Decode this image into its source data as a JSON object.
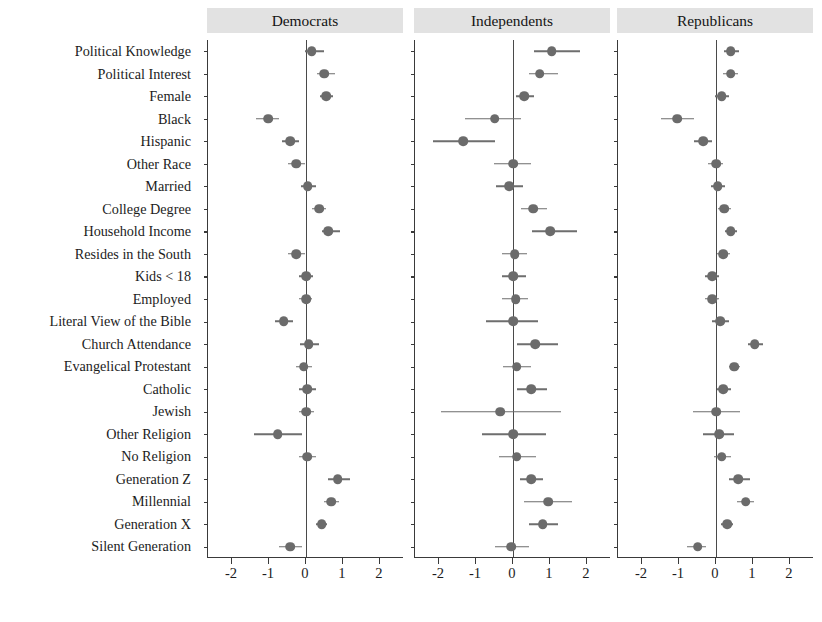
{
  "figure": {
    "panels": [
      "Democrats",
      "Independents",
      "Republicans"
    ],
    "xticks": [
      "-2",
      "-1",
      "0",
      "1",
      "2"
    ],
    "point_color": "#6b6b6b",
    "ci_color": "#6e6e6e",
    "header_background": "#e2e2e2"
  },
  "chart_data": {
    "type": "scatter",
    "title": "",
    "xlabel": "",
    "ylabel": "",
    "xlim": [
      -2.65,
      2.65
    ],
    "grid": false,
    "legend": "none",
    "panel_layout": "three horizontal panels sharing y-axis categories",
    "reference_line": 0,
    "xticks": [
      -2,
      -1,
      0,
      1,
      2
    ],
    "categories": [
      "Political Knowledge",
      "Political Interest",
      "Female",
      "Black",
      "Hispanic",
      "Other Race",
      "Married",
      "College Degree",
      "Household Income",
      "Resides in the South",
      "Kids < 18",
      "Employed",
      "Literal View of the Bible",
      "Church Attendance",
      "Evangelical Protestant",
      "Catholic",
      "Jewish",
      "Other Religion",
      "No Religion",
      "Generation Z",
      "Millennial",
      "Generation X",
      "Silent Generation"
    ],
    "series": [
      {
        "name": "Democrats",
        "values": [
          0.15,
          0.5,
          0.55,
          -1.02,
          -0.42,
          -0.26,
          0.05,
          0.35,
          0.6,
          -0.26,
          0.0,
          0.0,
          -0.6,
          0.07,
          -0.06,
          0.03,
          0.0,
          -0.76,
          0.03,
          0.86,
          0.68,
          0.42,
          -0.42
        ],
        "ci_low": [
          -0.04,
          0.3,
          0.38,
          -1.34,
          -0.66,
          -0.5,
          -0.14,
          0.17,
          0.42,
          -0.48,
          -0.2,
          -0.18,
          -0.84,
          -0.16,
          -0.26,
          -0.18,
          -0.2,
          -1.4,
          -0.2,
          0.6,
          0.5,
          0.28,
          -0.72
        ],
        "ci_high": [
          0.48,
          0.78,
          0.74,
          -0.72,
          -0.18,
          -0.02,
          0.26,
          0.55,
          0.92,
          -0.04,
          0.2,
          0.16,
          -0.36,
          0.34,
          0.16,
          0.26,
          0.22,
          -0.1,
          0.26,
          1.18,
          0.88,
          0.58,
          -0.12
        ]
      },
      {
        "name": "Independents",
        "values": [
          1.05,
          0.72,
          0.3,
          -0.5,
          -1.35,
          0.0,
          -0.1,
          0.55,
          1.0,
          0.05,
          0.0,
          0.07,
          0.0,
          0.6,
          0.1,
          0.5,
          -0.35,
          0.0,
          0.1,
          0.5,
          0.95,
          0.8,
          -0.05
        ],
        "ci_low": [
          0.58,
          0.42,
          0.08,
          -1.3,
          -2.15,
          -0.52,
          -0.45,
          0.22,
          0.52,
          -0.3,
          -0.3,
          -0.3,
          -0.72,
          0.12,
          -0.28,
          0.1,
          -1.95,
          -0.85,
          -0.38,
          0.2,
          0.3,
          0.42,
          -0.5
        ],
        "ci_high": [
          1.8,
          1.22,
          0.58,
          0.22,
          -0.48,
          0.5,
          0.28,
          0.92,
          1.72,
          0.38,
          0.34,
          0.4,
          0.68,
          1.22,
          0.5,
          0.92,
          1.3,
          0.88,
          0.62,
          0.82,
          1.6,
          1.22,
          0.42
        ]
      },
      {
        "name": "Republicans",
        "values": [
          0.4,
          0.4,
          0.15,
          -1.05,
          -0.35,
          0.0,
          0.05,
          0.22,
          0.4,
          0.2,
          -0.1,
          -0.1,
          0.12,
          1.05,
          0.5,
          0.2,
          0.0,
          0.08,
          0.15,
          0.6,
          0.8,
          0.3,
          -0.5
        ],
        "ci_low": [
          0.22,
          0.2,
          -0.04,
          -1.48,
          -0.6,
          -0.22,
          -0.14,
          0.06,
          0.24,
          0.04,
          -0.3,
          -0.3,
          -0.1,
          0.86,
          0.34,
          0.02,
          -0.62,
          -0.34,
          -0.06,
          0.34,
          0.58,
          0.14,
          -0.78
        ],
        "ci_high": [
          0.62,
          0.6,
          0.36,
          -0.6,
          -0.1,
          0.18,
          0.24,
          0.4,
          0.58,
          0.38,
          0.08,
          0.08,
          0.34,
          1.26,
          0.66,
          0.4,
          0.64,
          0.5,
          0.4,
          0.92,
          1.04,
          0.46,
          -0.26
        ]
      }
    ]
  }
}
